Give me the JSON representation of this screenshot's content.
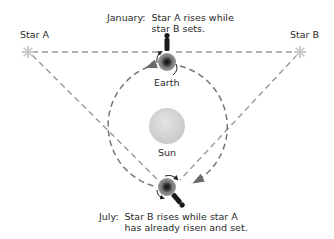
{
  "diagram": {
    "type": "astronomy-orbit-diagram",
    "colors": {
      "background": "#ffffff",
      "text": "#2a2a2a",
      "dashed_lines": "#8a8a8a",
      "sun": "#d6d6d6",
      "earth_outer": "#707070",
      "earth_inner": "#1a1a1a",
      "star": "#c8c8c8",
      "observer": "#1a1a1a"
    },
    "labels": {
      "star_a": "Star A",
      "star_b": "Star B",
      "earth": "Earth",
      "sun": "Sun"
    },
    "captions": {
      "january": {
        "head": "January:",
        "line1": "Star A rises while",
        "line2": "star B sets."
      },
      "july": {
        "head": "July:",
        "line1": "Star B rises while star A",
        "line2": "has already risen and set."
      }
    },
    "nodes": [
      {
        "id": "star_a",
        "x": 28,
        "y": 52
      },
      {
        "id": "star_b",
        "x": 300,
        "y": 52
      },
      {
        "id": "earth_january",
        "x": 167,
        "y": 62
      },
      {
        "id": "earth_july",
        "x": 167,
        "y": 187
      },
      {
        "id": "sun",
        "x": 167,
        "y": 125
      }
    ]
  }
}
